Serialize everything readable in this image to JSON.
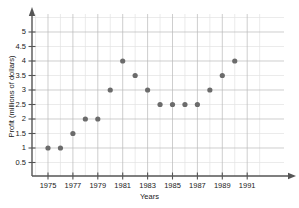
{
  "chart_data": {
    "type": "scatter",
    "title": "",
    "xlabel": "Years",
    "ylabel": "Profit (millions of dollars)",
    "x": [
      1975,
      1976,
      1977,
      1978,
      1979,
      1980,
      1981,
      1982,
      1983,
      1984,
      1985,
      1986,
      1987,
      1988,
      1989,
      1990
    ],
    "values": [
      1,
      1,
      1.5,
      2,
      2,
      3,
      4,
      3.5,
      3,
      2.5,
      2.5,
      2.5,
      2.5,
      3,
      3.5,
      4
    ],
    "points": [
      {
        "x": 1975,
        "y": 1
      },
      {
        "x": 1976,
        "y": 1
      },
      {
        "x": 1977,
        "y": 1.5
      },
      {
        "x": 1978,
        "y": 2
      },
      {
        "x": 1979,
        "y": 2
      },
      {
        "x": 1980,
        "y": 3
      },
      {
        "x": 1981,
        "y": 4
      },
      {
        "x": 1982,
        "y": 3.5
      },
      {
        "x": 1983,
        "y": 3
      },
      {
        "x": 1984,
        "y": 2.5
      },
      {
        "x": 1985,
        "y": 2.5
      },
      {
        "x": 1986,
        "y": 2.5
      },
      {
        "x": 1987,
        "y": 2.5
      },
      {
        "x": 1988,
        "y": 3
      },
      {
        "x": 1989,
        "y": 3.5
      },
      {
        "x": 1990,
        "y": 4
      }
    ],
    "xlim": [
      1974,
      1992
    ],
    "ylim": [
      0,
      5.5
    ],
    "xticks": [
      1975,
      1977,
      1979,
      1981,
      1983,
      1985,
      1987,
      1989,
      1991
    ],
    "xtick_labels": [
      "1975",
      "1977",
      "1979",
      "1981",
      "1983",
      "1985",
      "1987",
      "1989",
      "1991"
    ],
    "yticks": [
      0.5,
      1,
      1.5,
      2,
      2.5,
      3,
      3.5,
      4,
      4.5,
      5
    ],
    "ytick_labels": [
      "0.5",
      "1",
      "1.5",
      "2",
      "2.5",
      "3",
      "3.5",
      "4",
      "4.5",
      "5"
    ],
    "grid": true,
    "legend": null,
    "colors": {
      "point": "#6b6b6b",
      "grid_major": "#b9b9b9",
      "grid_minor": "#e2e2e2",
      "axis": "#555555",
      "text": "#1a1a1a",
      "background": "#ffffff"
    }
  }
}
